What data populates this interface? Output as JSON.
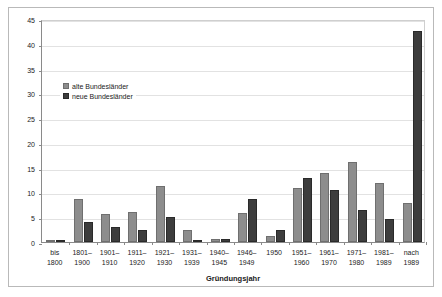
{
  "chart_data": {
    "type": "bar",
    "title": "",
    "subtitle": "",
    "xlabel": "Gründungsjahr",
    "ylabel": "Anteil [%]",
    "ylim": [
      0,
      45
    ],
    "yticks": [
      0,
      5,
      10,
      15,
      20,
      25,
      30,
      35,
      40,
      45
    ],
    "ytick_labels": [
      "0",
      "5",
      "10",
      "15",
      "20",
      "25",
      "30",
      "35",
      "40",
      "45"
    ],
    "grid": "horizontal",
    "legend_position": "upper-left-inside",
    "categories": [
      "bis\n1800",
      "1801–\n1900",
      "1901–\n1910",
      "1911–\n1920",
      "1921–\n1930",
      "1931–\n1939",
      "1940–\n1945",
      "1946–\n1949",
      "1950",
      "1951–\n1960",
      "1961–\n1970",
      "1971–\n1980",
      "1981–\n1989",
      "nach\n1989"
    ],
    "series": [
      {
        "name": "alte Bundesländer",
        "color": "#8d8d8d",
        "values": [
          0.3,
          8.7,
          5.7,
          6.1,
          11.3,
          2.5,
          0.6,
          5.8,
          1.2,
          10.9,
          14.0,
          16.2,
          12.0,
          7.9
        ]
      },
      {
        "name": "neue Bundesländer",
        "color": "#3d3d3d",
        "values": [
          0.3,
          4.0,
          3.0,
          2.5,
          5.0,
          0.3,
          0.6,
          8.6,
          2.4,
          13.0,
          10.4,
          6.5,
          4.6,
          42.5
        ]
      }
    ]
  },
  "legend": {
    "items": [
      {
        "label": "alte Bundesländer",
        "color": "#8d8d8d"
      },
      {
        "label": "neue Bundesländer",
        "color": "#3d3d3d"
      }
    ]
  },
  "axes": {
    "y_title": "Anteil [%]",
    "x_title": "Gründungsjahr"
  },
  "colors": {
    "alte": "#8d8d8d",
    "neue": "#3d3d3d",
    "grid": "#e2e2e2",
    "axis": "#8a8a8a",
    "frame": "#b9b9b9",
    "text": "#1a1a1a"
  }
}
